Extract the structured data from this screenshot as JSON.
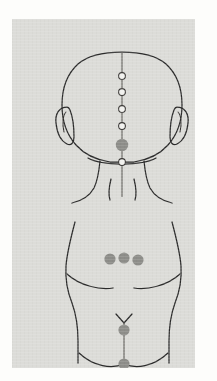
{
  "document": {
    "title": "Acupuncture points – posterior head and lumbosacral region",
    "panel": {
      "x": 12,
      "y": 19,
      "width": 183,
      "height": 349,
      "background_color": "#dcdcd8"
    },
    "colors": {
      "background": "#fdfdfb",
      "panel": "#dcdcd8",
      "outline": "#2b2b2b",
      "midline": "#55534f",
      "point_hollow_fill": "#f2f2ef",
      "point_hollow_stroke": "#3a3836",
      "point_solid": "#8d8d89"
    }
  },
  "figures": [
    {
      "id": "posterior-head",
      "name": "Posterior view of head and neck",
      "points": [
        {
          "id": "head-midline-1",
          "style": "hollow",
          "cx": 110,
          "cy": 57,
          "r": 3.4
        },
        {
          "id": "head-midline-2",
          "style": "hollow",
          "cx": 110,
          "cy": 73,
          "r": 3.4
        },
        {
          "id": "head-midline-3",
          "style": "hollow",
          "cx": 110,
          "cy": 90,
          "r": 3.4
        },
        {
          "id": "head-midline-4",
          "style": "hollow",
          "cx": 110,
          "cy": 107,
          "r": 3.4
        },
        {
          "id": "head-occiput-main",
          "style": "solid",
          "cx": 110,
          "cy": 126,
          "r": 6.2
        },
        {
          "id": "head-hairline",
          "style": "hollow",
          "cx": 110,
          "cy": 143,
          "r": 3.4
        }
      ],
      "point_counts": {
        "hollow": 5,
        "solid": 1,
        "total": 6
      }
    },
    {
      "id": "lumbosacral-back",
      "name": "Posterior view of lower back, hips and gluteal region",
      "points": [
        {
          "id": "lumbar-left",
          "style": "solid",
          "cx": 98,
          "cy": 240,
          "r": 5.6
        },
        {
          "id": "lumbar-center",
          "style": "solid",
          "cx": 112,
          "cy": 239,
          "r": 5.6
        },
        {
          "id": "lumbar-right",
          "style": "solid",
          "cx": 126,
          "cy": 241,
          "r": 5.6
        },
        {
          "id": "sacral-upper",
          "style": "solid",
          "cx": 112,
          "cy": 311,
          "r": 5.6
        },
        {
          "id": "sacral-lower",
          "style": "solid",
          "cx": 112,
          "cy": 345,
          "r": 5.6
        }
      ],
      "point_counts": {
        "hollow": 0,
        "solid": 5,
        "total": 5
      },
      "point_groups": [
        {
          "id": "lumbar-row",
          "orientation": "horizontal",
          "count": 3
        },
        {
          "id": "sacral-column",
          "orientation": "vertical",
          "count": 2
        }
      ]
    }
  ],
  "chart_data": {
    "type": "scatter",
    "xlabel": "",
    "ylabel": "",
    "series": [
      {
        "name": "Posterior head – midline points (hollow)",
        "marker": "hollow-circle",
        "x": [
          110,
          110,
          110,
          110,
          110
        ],
        "y": [
          57,
          73,
          90,
          107,
          143
        ]
      },
      {
        "name": "Posterior head – occipital point (solid)",
        "marker": "solid-circle",
        "x": [
          110
        ],
        "y": [
          126
        ]
      },
      {
        "name": "Lumbar row (solid)",
        "marker": "solid-circle",
        "x": [
          98,
          112,
          126
        ],
        "y": [
          240,
          239,
          241
        ]
      },
      {
        "name": "Sacral column (solid)",
        "marker": "solid-circle",
        "x": [
          112,
          112
        ],
        "y": [
          311,
          345
        ]
      }
    ]
  }
}
